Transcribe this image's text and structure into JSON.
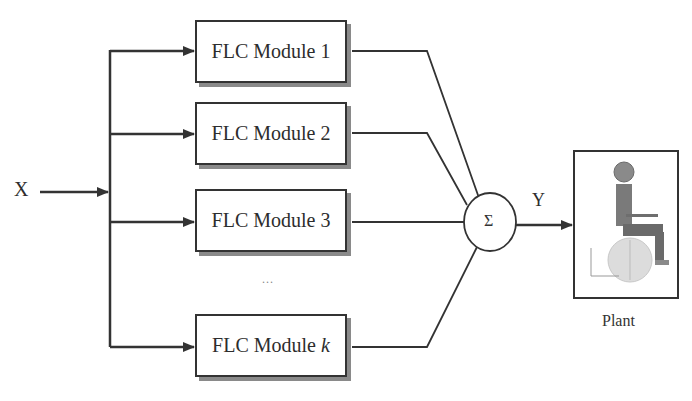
{
  "diagram": {
    "input_label": "X",
    "output_label": "Y",
    "summer_symbol": "Σ",
    "ellipsis": "...",
    "modules": [
      {
        "label_prefix": "FLC Module ",
        "label_index": "1"
      },
      {
        "label_prefix": "FLC Module ",
        "label_index": "2"
      },
      {
        "label_prefix": "FLC Module ",
        "label_index": "3"
      },
      {
        "label_prefix": "FLC Module ",
        "label_index": "k"
      }
    ],
    "plant": {
      "label": "Plant",
      "image": "wheelchair-seated-human-model"
    },
    "colors": {
      "line": "#333333",
      "shadow": "#8a8a8a",
      "figure_body": "#7a7a7a",
      "figure_wheel": "#d8d8d8"
    }
  }
}
